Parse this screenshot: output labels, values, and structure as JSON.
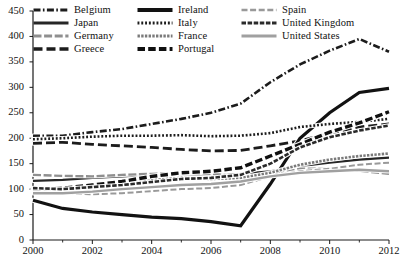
{
  "chart_data": {
    "type": "line",
    "title": "",
    "subtitle": "",
    "xlabel": "",
    "ylabel": "",
    "xlim": [
      2000,
      2012
    ],
    "ylim": [
      0,
      450
    ],
    "x": [
      2000,
      2001,
      2002,
      2003,
      2004,
      2005,
      2006,
      2007,
      2008,
      2009,
      2010,
      2011,
      2012
    ],
    "y_ticks": [
      0,
      50,
      100,
      150,
      200,
      250,
      300,
      350,
      400,
      450
    ],
    "x_ticks": [
      2000,
      2002,
      2004,
      2006,
      2008,
      2010,
      2012
    ],
    "x_minor_ticks": [
      2001,
      2003,
      2005,
      2007,
      2009,
      2011
    ],
    "grid": false,
    "legend_position": "top-left",
    "legend_columns": 3,
    "series": [
      {
        "name": "Belgium",
        "style": "dash-dot",
        "values": [
          205,
          205,
          212,
          218,
          228,
          238,
          250,
          268,
          310,
          345,
          372,
          395,
          370
        ]
      },
      {
        "name": "Japan",
        "style": "solid-thin",
        "values": [
          116,
          118,
          122,
          125,
          128,
          130,
          128,
          130,
          135,
          145,
          152,
          158,
          162
        ]
      },
      {
        "name": "Germany",
        "style": "long-dash-light",
        "values": [
          128,
          126,
          125,
          128,
          130,
          132,
          130,
          125,
          128,
          140,
          140,
          136,
          130
        ]
      },
      {
        "name": "Greece",
        "style": "dash-wide",
        "values": [
          190,
          192,
          188,
          185,
          182,
          178,
          175,
          176,
          185,
          195,
          210,
          222,
          228
        ]
      },
      {
        "name": "Ireland",
        "style": "solid-thick",
        "values": [
          78,
          62,
          55,
          50,
          45,
          42,
          36,
          28,
          110,
          200,
          250,
          290,
          298
        ]
      },
      {
        "name": "Italy",
        "style": "dotted",
        "values": [
          198,
          200,
          203,
          205,
          205,
          206,
          204,
          205,
          210,
          222,
          228,
          232,
          238
        ]
      },
      {
        "name": "France",
        "style": "hatched",
        "values": [
          100,
          102,
          108,
          112,
          118,
          122,
          120,
          122,
          132,
          148,
          158,
          165,
          170
        ]
      },
      {
        "name": "Portugal",
        "style": "dash-bold",
        "values": [
          98,
          102,
          108,
          115,
          125,
          132,
          135,
          142,
          165,
          188,
          212,
          230,
          252
        ]
      },
      {
        "name": "Spain",
        "style": "dash-thin-light",
        "values": [
          94,
          92,
          90,
          92,
          96,
          100,
          102,
          108,
          125,
          135,
          140,
          148,
          152
        ]
      },
      {
        "name": "United Kingdom",
        "style": "dot-dash-dense",
        "values": [
          102,
          100,
          104,
          108,
          114,
          120,
          122,
          128,
          150,
          182,
          202,
          215,
          225
        ]
      },
      {
        "name": "United States",
        "style": "solid-grey",
        "values": [
          92,
          92,
          95,
          100,
          104,
          108,
          110,
          115,
          125,
          132,
          135,
          138,
          135
        ]
      }
    ]
  },
  "axes": {
    "y_tick_labels": [
      "450",
      "400",
      "350",
      "300",
      "250",
      "200",
      "150",
      "100",
      "50",
      "0"
    ],
    "x_tick_labels": [
      "2000",
      "2002",
      "2004",
      "2006",
      "2008",
      "2010",
      "2012"
    ]
  },
  "legend": {
    "items": [
      {
        "label": "Belgium",
        "swatch": "dash-dot-swatch"
      },
      {
        "label": "Ireland",
        "swatch": "solid-thick-swatch"
      },
      {
        "label": "Spain",
        "swatch": "dash-thin-light-swatch"
      },
      {
        "label": "Japan",
        "swatch": "solid-thin-swatch"
      },
      {
        "label": "Italy",
        "swatch": "dotted-swatch"
      },
      {
        "label": "United Kingdom",
        "swatch": "dot-dash-dense-swatch"
      },
      {
        "label": "Germany",
        "swatch": "long-dash-light-swatch"
      },
      {
        "label": "France",
        "swatch": "hatched-swatch"
      },
      {
        "label": "United States",
        "swatch": "solid-grey-swatch"
      },
      {
        "label": "Greece",
        "swatch": "dash-wide-swatch"
      },
      {
        "label": "Portugal",
        "swatch": "dash-bold-swatch"
      }
    ]
  },
  "colors": {
    "ink": "#1a1a1a",
    "light_ink": "#6f6f6f",
    "mid_ink": "#4a4a4a",
    "background": "#ffffff"
  }
}
